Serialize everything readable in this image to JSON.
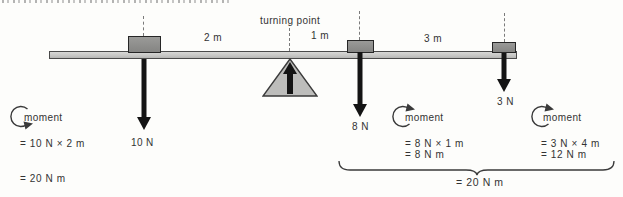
{
  "figure_title": "moments-on-a-beam-diagram",
  "labels": {
    "turning_point": "turning point"
  },
  "distances": [
    {
      "label": "2 m"
    },
    {
      "label": "1 m"
    },
    {
      "label": "3 m"
    }
  ],
  "forces": [
    {
      "label": "10 N"
    },
    {
      "label": "8 N"
    },
    {
      "label": "3 N"
    }
  ],
  "moments": [
    {
      "title": "moment",
      "direction": "anticlockwise",
      "calc": "= 10 N × 2 m",
      "result": "= 20 N m"
    },
    {
      "title": "moment",
      "direction": "clockwise",
      "calc": "= 8 N × 1 m",
      "result": "= 8 N m"
    },
    {
      "title": "moment",
      "direction": "clockwise",
      "calc": "= 3 N × 4 m",
      "result": "= 12 N m"
    }
  ],
  "brace": {
    "total": "= 20 N m"
  },
  "colors": {
    "background": "#fdfdfb",
    "beam_fill": "#c9c9c7",
    "beam_border": "#4a4a4a",
    "block_fill": "#8f8f8d",
    "block_border": "#262626",
    "triangle_fill": "#bdbdbb",
    "arrow_color": "#141414",
    "text_color": "#333333",
    "dashed_line": "#7a7a7a"
  }
}
